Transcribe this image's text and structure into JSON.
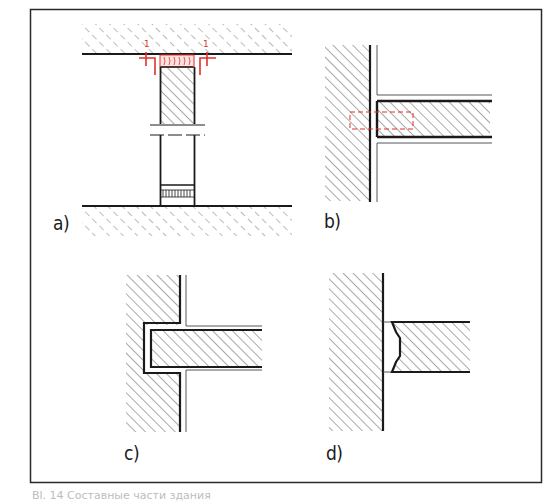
{
  "figure": {
    "frame_color": "#2a2a2a",
    "line_color": "#1a1a1a",
    "hatch_color": "#555555",
    "accent_red": "#e0312b",
    "panels": [
      {
        "id": "a",
        "label": "a)",
        "description": "column between two slabs with top and bottom joint fillers, section mark 1-1"
      },
      {
        "id": "b",
        "label": "b)",
        "description": "slab butted against wall with dashed red connection zone"
      },
      {
        "id": "c",
        "label": "c)",
        "description": "slab seated in wall recess"
      },
      {
        "id": "d",
        "label": "d)",
        "description": "slab with profiled end joint against wall"
      }
    ],
    "section_marks": [
      "1",
      "1"
    ],
    "caption": "Bl. 14   Составные части здания"
  }
}
